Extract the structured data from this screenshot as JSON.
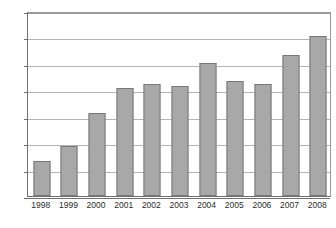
{
  "chart_data": {
    "type": "bar",
    "title": "",
    "subtitle": "",
    "xlabel": "",
    "ylabel": "",
    "categories": [
      "1998",
      "1999",
      "2000",
      "2001",
      "2002",
      "2003",
      "2004",
      "2005",
      "2006",
      "2007",
      "2008"
    ],
    "values": [
      133,
      188,
      315,
      410,
      422,
      417,
      502,
      437,
      424,
      532,
      606
    ],
    "series": [
      {
        "name": "",
        "values": [
          133,
          188,
          315,
          410,
          422,
          417,
          502,
          437,
          424,
          532,
          606
        ]
      }
    ],
    "ylim": [
      0,
      700
    ],
    "ytick_labels": [
      "0",
      "100",
      "200",
      "300",
      "400",
      "500",
      "600",
      "700"
    ],
    "ytick_values": [
      0,
      100,
      200,
      300,
      400,
      500,
      600,
      700
    ],
    "grid": true,
    "grid_orientation": "horizontal",
    "legend": false,
    "legend_position": "none",
    "annotations": [],
    "colors": {
      "bar_fill": "#a8a8a8",
      "bar_stroke": "#787878",
      "gridline": "#b4b4b4",
      "axis": "#6e6e6e",
      "text": "#2b2b2b",
      "background": "#ffffff"
    }
  }
}
